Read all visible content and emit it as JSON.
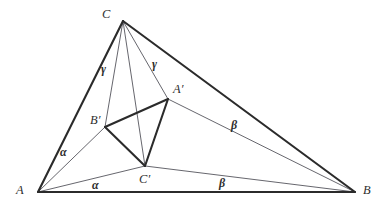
{
  "figure": {
    "type": "geometry-diagram",
    "background_color": "#ffffff",
    "stroke_color_thick": "#2b2b2b",
    "stroke_color_thin": "#55555c"
  },
  "points": {
    "A": {
      "label": "A",
      "x": 38,
      "y": 192,
      "label_x": 16,
      "label_y": 184
    },
    "B": {
      "label": "B",
      "x": 355,
      "y": 192,
      "label_x": 363,
      "label_y": 184
    },
    "C": {
      "label": "C",
      "x": 123,
      "y": 21,
      "label_x": 102,
      "label_y": 8
    },
    "Ap": {
      "label": "A′",
      "x": 168,
      "y": 99,
      "label_x": 173,
      "label_y": 83
    },
    "Bp": {
      "label": "B′",
      "x": 105,
      "y": 127,
      "label_x": 90,
      "label_y": 114
    },
    "Cp": {
      "label": "C′",
      "x": 145,
      "y": 166,
      "label_x": 139,
      "label_y": 173
    }
  },
  "edges": [
    {
      "name": "side-AB",
      "from": "A",
      "to": "B",
      "weight": "thick"
    },
    {
      "name": "side-AC",
      "from": "A",
      "to": "C",
      "weight": "thick"
    },
    {
      "name": "side-CB",
      "from": "C",
      "to": "B",
      "weight": "thick"
    },
    {
      "name": "inner-Ap-Bp",
      "from": "Ap",
      "to": "Bp",
      "weight": "thick"
    },
    {
      "name": "inner-Bp-Cp",
      "from": "Bp",
      "to": "Cp",
      "weight": "thick"
    },
    {
      "name": "inner-Cp-Ap",
      "from": "Cp",
      "to": "Ap",
      "weight": "thick"
    },
    {
      "name": "cevian-C-Bp",
      "from": "C",
      "to": "Bp",
      "weight": "thin"
    },
    {
      "name": "cevian-C-Cp",
      "from": "C",
      "to": "Cp",
      "weight": "thin"
    },
    {
      "name": "cevian-C-Ap",
      "from": "C",
      "to": "Ap",
      "weight": "thin"
    },
    {
      "name": "cevian-A-Bp",
      "from": "A",
      "to": "Bp",
      "weight": "thin"
    },
    {
      "name": "cevian-A-Cp",
      "from": "A",
      "to": "Cp",
      "weight": "thin"
    },
    {
      "name": "cevian-B-Ap",
      "from": "B",
      "to": "Ap",
      "weight": "thin"
    },
    {
      "name": "cevian-B-Cp",
      "from": "B",
      "to": "Cp",
      "weight": "thin"
    }
  ],
  "angle_labels": [
    {
      "name": "gamma-left",
      "text": "γ",
      "x": 101,
      "y": 63
    },
    {
      "name": "gamma-right",
      "text": "γ",
      "x": 152,
      "y": 58
    },
    {
      "name": "alpha-upper",
      "text": "α",
      "x": 60,
      "y": 146
    },
    {
      "name": "alpha-lower",
      "text": "α",
      "x": 92,
      "y": 179
    },
    {
      "name": "beta-upper",
      "text": "β",
      "x": 231,
      "y": 119
    },
    {
      "name": "beta-lower",
      "text": "β",
      "x": 219,
      "y": 177
    }
  ]
}
